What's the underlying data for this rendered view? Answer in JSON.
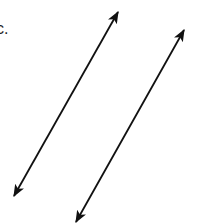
{
  "label": "c.",
  "lines": [
    {
      "name": "line-1",
      "x1": 118,
      "y1": 12,
      "x2": 14,
      "y2": 196
    },
    {
      "name": "line-2",
      "x1": 184,
      "y1": 30,
      "x2": 76,
      "y2": 222
    }
  ],
  "colors": {
    "stroke": "#111111",
    "background": "#ffffff"
  }
}
